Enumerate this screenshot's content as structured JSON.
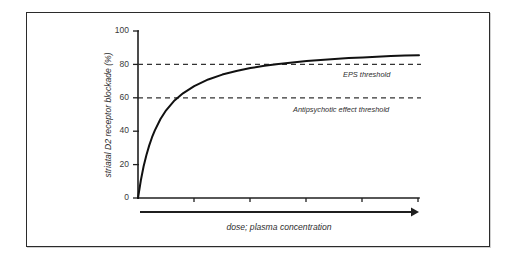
{
  "figure": {
    "background_color": "#ffffff",
    "border_color": "#2b2b2b",
    "curve_color": "#111111",
    "threshold_color": "#333333"
  },
  "chart_data": {
    "type": "line",
    "title": "",
    "subtitle": "",
    "xlabel": "dose; plasma concentration",
    "ylabel": "striatal D2 receptor blockade (%)",
    "xlim": [
      0,
      100
    ],
    "ylim": [
      0,
      100
    ],
    "grid": false,
    "legend_position": "none",
    "x_tick_labels": [
      "",
      "",
      "",
      "",
      ""
    ],
    "y_tick_labels": [
      "0",
      "20",
      "40",
      "60",
      "80",
      "100"
    ],
    "y_ticks": [
      0,
      20,
      40,
      60,
      80,
      100
    ],
    "x_axis_arrow": true,
    "series": [
      {
        "name": "striatal D2 receptor blockade",
        "x": [
          0,
          1,
          2,
          3,
          4,
          5,
          6,
          8,
          10,
          13,
          16,
          20,
          25,
          30,
          35,
          40,
          45,
          50,
          55,
          60,
          65,
          70,
          75,
          80,
          85,
          90,
          95,
          100
        ],
        "values": [
          0,
          10.5,
          19.0,
          25.8,
          31.5,
          36.4,
          40.5,
          47.3,
          52.5,
          58.4,
          62.7,
          67.0,
          71.0,
          73.9,
          76.1,
          77.8,
          79.2,
          80.3,
          81.2,
          82.0,
          82.7,
          83.3,
          83.8,
          84.2,
          84.6,
          85.0,
          85.3,
          85.5
        ]
      }
    ],
    "annotations": [
      {
        "name": "eps-threshold",
        "label": "EPS threshold",
        "value": 80,
        "style": "dashed-horizontal"
      },
      {
        "name": "antipsychotic-effect-threshold",
        "label": "Antipsychotic effect threshold",
        "value": 60,
        "style": "dashed-horizontal"
      }
    ]
  }
}
